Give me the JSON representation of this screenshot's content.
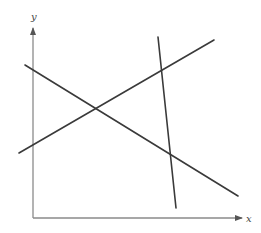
{
  "diagram": {
    "title": "",
    "axes": {
      "x_label": "x",
      "y_label": "y",
      "origin": [
        33,
        218
      ],
      "x_end": [
        242,
        218
      ],
      "y_end": [
        33,
        28
      ],
      "color": "#8a8a8a"
    },
    "lines": [
      {
        "name": "descending-line",
        "x1": 25,
        "y1": 65,
        "x2": 238,
        "y2": 196,
        "color": "#3a3a3a"
      },
      {
        "name": "ascending-line",
        "x1": 19,
        "y1": 153,
        "x2": 214,
        "y2": 40,
        "color": "#3a3a3a"
      },
      {
        "name": "steep-line",
        "x1": 158,
        "y1": 37,
        "x2": 176,
        "y2": 208,
        "color": "#3a3a3a"
      }
    ]
  }
}
